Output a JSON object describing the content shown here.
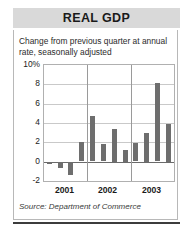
{
  "title": "REAL GDP",
  "subtitle": "Change from previous quarter at annual rate, seasonally adjusted",
  "source": "Source: Department of Commerce",
  "colors": {
    "bar": "#6e6e6e",
    "banner": "#d9d9d9",
    "grid": "#c9c9c9",
    "frame": "#b0b0b0",
    "rule": "#3c3c3c"
  },
  "chart_data": {
    "type": "bar",
    "title": "REAL GDP",
    "subtitle": "Change from previous quarter at annual rate, seasonally adjusted",
    "xlabel": "",
    "ylabel": "",
    "ylim": [
      -2,
      10
    ],
    "yticks": [
      -2,
      0,
      2,
      4,
      6,
      8,
      10
    ],
    "ytick_labels": [
      "-2",
      "0",
      "2",
      "4",
      "6",
      "8",
      "10%"
    ],
    "grid": true,
    "legend": "none",
    "group_labels": [
      "2001",
      "2002",
      "2003"
    ],
    "categories": [
      "2001 Q1",
      "2001 Q2",
      "2001 Q3",
      "2001 Q4",
      "2002 Q1",
      "2002 Q2",
      "2002 Q3",
      "2002 Q4",
      "2003 Q1",
      "2003 Q2",
      "2003 Q3",
      "2003 Q4"
    ],
    "values": [
      -0.2,
      -0.6,
      -1.3,
      2.0,
      4.7,
      1.8,
      3.4,
      1.2,
      1.9,
      3.0,
      8.1,
      3.9
    ],
    "units": "percent change, annual rate"
  }
}
